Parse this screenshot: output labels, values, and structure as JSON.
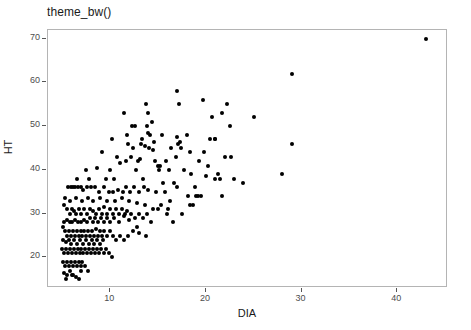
{
  "chart_data": {
    "type": "scatter",
    "title": "theme_bw()",
    "xlabel": "DIA",
    "ylabel": "HT",
    "grid": false,
    "legend": "none",
    "xlim": [
      3.5,
      45.3
    ],
    "ylim": [
      13.0,
      72.0
    ],
    "xticks": [
      10,
      20,
      30,
      40
    ],
    "xticklabels": [
      "10",
      "20",
      "30",
      "40"
    ],
    "yticks": [
      20,
      30,
      40,
      50,
      60,
      70
    ],
    "yticklabels": [
      "20",
      "30",
      "40",
      "50",
      "60",
      "70"
    ],
    "point_color": "#000000",
    "panel_border_color": "#b4b4b4",
    "panel_background": "#ffffff",
    "n_points": 271,
    "series": [
      {
        "name": "trees",
        "points": [
          [
            43.0,
            70.0
          ],
          [
            29.0,
            62.0
          ],
          [
            29.0,
            46.0
          ],
          [
            28.0,
            39.0
          ],
          [
            25.0,
            52.0
          ],
          [
            17.0,
            58.0
          ],
          [
            19.7,
            56.0
          ],
          [
            13.7,
            55.0
          ],
          [
            17.2,
            55.0
          ],
          [
            22.2,
            55.0
          ],
          [
            11.4,
            53.0
          ],
          [
            14.0,
            53.0
          ],
          [
            21.7,
            53.0
          ],
          [
            20.6,
            52.0
          ],
          [
            12.3,
            50.0
          ],
          [
            14.4,
            51.0
          ],
          [
            22.5,
            50.0
          ],
          [
            12.6,
            50.0
          ],
          [
            13.8,
            50.0
          ],
          [
            10.2,
            47.0
          ],
          [
            11.9,
            46.0
          ],
          [
            13.3,
            47.0
          ],
          [
            14.2,
            48.0
          ],
          [
            15.4,
            48.0
          ],
          [
            17.0,
            47.5
          ],
          [
            17.3,
            46.5
          ],
          [
            18.0,
            48.0
          ],
          [
            20.4,
            47.0
          ],
          [
            20.9,
            47.0
          ],
          [
            21.0,
            47.0
          ],
          [
            13.6,
            45.5
          ],
          [
            14.1,
            45.0
          ],
          [
            14.5,
            44.5
          ],
          [
            16.4,
            45.0
          ],
          [
            17.1,
            46.0
          ],
          [
            17.4,
            45.0
          ],
          [
            18.3,
            44.0
          ],
          [
            19.8,
            44.0
          ],
          [
            9.1,
            44.0
          ],
          [
            12.2,
            43.0
          ],
          [
            12.9,
            42.0
          ],
          [
            13.1,
            42.5
          ],
          [
            14.7,
            42.0
          ],
          [
            15.0,
            41.0
          ],
          [
            22.0,
            43.0
          ],
          [
            23.9,
            37.0
          ],
          [
            22.9,
            38.0
          ],
          [
            21.5,
            38.0
          ],
          [
            8.6,
            40.5
          ],
          [
            7.5,
            40.0
          ],
          [
            10.0,
            40.0
          ],
          [
            11.0,
            41.5
          ],
          [
            12.7,
            40.0
          ],
          [
            15.1,
            40.0
          ],
          [
            17.7,
            40.0
          ],
          [
            18.4,
            39.0
          ],
          [
            20.0,
            38.5
          ],
          [
            20.9,
            38.0
          ],
          [
            6.5,
            38.0
          ],
          [
            7.8,
            38.0
          ],
          [
            9.6,
            38.0
          ],
          [
            10.4,
            38.0
          ],
          [
            13.4,
            38.0
          ],
          [
            15.5,
            37.0
          ],
          [
            16.7,
            37.0
          ],
          [
            18.9,
            36.0
          ],
          [
            19.5,
            34.0
          ],
          [
            21.7,
            34.0
          ],
          [
            5.6,
            36.0
          ],
          [
            5.9,
            36.0
          ],
          [
            6.1,
            36.0
          ],
          [
            6.3,
            36.0
          ],
          [
            6.6,
            36.0
          ],
          [
            6.9,
            36.0
          ],
          [
            7.2,
            35.5
          ],
          [
            7.6,
            36.0
          ],
          [
            8.0,
            36.0
          ],
          [
            8.4,
            36.0
          ],
          [
            8.8,
            35.0
          ],
          [
            9.3,
            36.0
          ],
          [
            9.9,
            35.0
          ],
          [
            10.3,
            35.0
          ],
          [
            10.8,
            35.5
          ],
          [
            11.3,
            35.0
          ],
          [
            11.7,
            36.0
          ],
          [
            12.1,
            35.0
          ],
          [
            12.5,
            36.0
          ],
          [
            13.0,
            35.0
          ],
          [
            13.5,
            36.0
          ],
          [
            14.0,
            35.5
          ],
          [
            14.8,
            35.0
          ],
          [
            15.7,
            35.0
          ],
          [
            16.3,
            33.0
          ],
          [
            17.0,
            36.0
          ],
          [
            18.1,
            34.0
          ],
          [
            19.0,
            34.0
          ],
          [
            5.2,
            32.0
          ],
          [
            5.5,
            31.0
          ],
          [
            5.8,
            30.0
          ],
          [
            6.0,
            31.0
          ],
          [
            6.2,
            30.5
          ],
          [
            6.4,
            30.0
          ],
          [
            6.7,
            31.0
          ],
          [
            7.0,
            30.0
          ],
          [
            7.3,
            31.0
          ],
          [
            7.6,
            30.0
          ],
          [
            7.9,
            31.0
          ],
          [
            8.2,
            30.5
          ],
          [
            8.5,
            30.0
          ],
          [
            8.8,
            31.0
          ],
          [
            9.1,
            30.0
          ],
          [
            9.4,
            31.5
          ],
          [
            9.7,
            30.0
          ],
          [
            10.0,
            31.0
          ],
          [
            10.3,
            30.0
          ],
          [
            10.6,
            31.0
          ],
          [
            10.9,
            30.0
          ],
          [
            11.2,
            31.0
          ],
          [
            11.5,
            30.0
          ],
          [
            11.8,
            30.5
          ],
          [
            12.2,
            30.0
          ],
          [
            12.6,
            29.0
          ],
          [
            13.0,
            30.0
          ],
          [
            13.4,
            29.0
          ],
          [
            13.8,
            30.0
          ],
          [
            14.3,
            28.0
          ],
          [
            15.0,
            31.0
          ],
          [
            15.9,
            30.0
          ],
          [
            16.6,
            28.0
          ],
          [
            17.5,
            30.0
          ],
          [
            18.3,
            32.0
          ],
          [
            19.2,
            34.0
          ],
          [
            5.1,
            27.0
          ],
          [
            5.3,
            26.0
          ],
          [
            5.5,
            25.0
          ],
          [
            5.7,
            26.0
          ],
          [
            5.9,
            25.0
          ],
          [
            6.1,
            26.0
          ],
          [
            6.3,
            25.0
          ],
          [
            6.5,
            26.0
          ],
          [
            6.7,
            25.0
          ],
          [
            6.9,
            26.0
          ],
          [
            7.1,
            25.0
          ],
          [
            7.3,
            26.0
          ],
          [
            7.5,
            25.0
          ],
          [
            7.7,
            26.0
          ],
          [
            7.9,
            25.0
          ],
          [
            8.1,
            26.0
          ],
          [
            8.3,
            25.0
          ],
          [
            8.5,
            26.5
          ],
          [
            8.7,
            25.0
          ],
          [
            8.9,
            26.0
          ],
          [
            9.1,
            25.0
          ],
          [
            9.4,
            26.0
          ],
          [
            9.7,
            25.0
          ],
          [
            10.0,
            26.0
          ],
          [
            10.3,
            25.0
          ],
          [
            10.6,
            24.0
          ],
          [
            11.0,
            25.0
          ],
          [
            11.4,
            24.0
          ],
          [
            11.9,
            25.0
          ],
          [
            12.4,
            26.0
          ],
          [
            13.0,
            25.5
          ],
          [
            13.7,
            25.0
          ],
          [
            5.0,
            22.0
          ],
          [
            5.2,
            21.0
          ],
          [
            5.4,
            22.0
          ],
          [
            5.6,
            21.0
          ],
          [
            5.8,
            22.0
          ],
          [
            6.0,
            21.0
          ],
          [
            6.2,
            22.0
          ],
          [
            6.4,
            21.0
          ],
          [
            6.6,
            22.0
          ],
          [
            6.8,
            21.0
          ],
          [
            7.0,
            22.0
          ],
          [
            7.2,
            21.0
          ],
          [
            7.4,
            22.0
          ],
          [
            7.6,
            21.0
          ],
          [
            7.8,
            22.0
          ],
          [
            8.0,
            21.0
          ],
          [
            8.2,
            22.0
          ],
          [
            8.4,
            21.0
          ],
          [
            8.6,
            22.0
          ],
          [
            8.8,
            21.0
          ],
          [
            9.0,
            22.0
          ],
          [
            9.3,
            21.0
          ],
          [
            9.6,
            22.0
          ],
          [
            9.9,
            21.0
          ],
          [
            10.2,
            20.0
          ],
          [
            5.1,
            19.0
          ],
          [
            5.3,
            18.0
          ],
          [
            5.5,
            19.0
          ],
          [
            5.7,
            18.0
          ],
          [
            5.9,
            19.0
          ],
          [
            6.1,
            18.0
          ],
          [
            6.3,
            19.0
          ],
          [
            6.5,
            18.0
          ],
          [
            6.7,
            19.0
          ],
          [
            6.9,
            18.0
          ],
          [
            7.1,
            19.0
          ],
          [
            7.4,
            18.0
          ],
          [
            7.7,
            17.0
          ],
          [
            5.2,
            16.5
          ],
          [
            5.5,
            16.0
          ],
          [
            5.8,
            17.0
          ],
          [
            6.1,
            16.0
          ],
          [
            6.4,
            15.5
          ],
          [
            6.7,
            15.0
          ],
          [
            5.4,
            15.0
          ],
          [
            6.0,
            16.0
          ],
          [
            6.9,
            17.0
          ],
          [
            5.05,
            24.0
          ],
          [
            5.35,
            23.5
          ],
          [
            5.65,
            24.0
          ],
          [
            5.95,
            23.0
          ],
          [
            6.25,
            24.0
          ],
          [
            6.55,
            23.0
          ],
          [
            6.85,
            24.0
          ],
          [
            7.15,
            23.0
          ],
          [
            7.45,
            24.0
          ],
          [
            7.75,
            23.0
          ],
          [
            8.05,
            24.0
          ],
          [
            8.35,
            23.0
          ],
          [
            8.65,
            24.0
          ],
          [
            8.95,
            23.0
          ],
          [
            9.25,
            24.0
          ],
          [
            5.15,
            28.0
          ],
          [
            5.45,
            28.5
          ],
          [
            5.75,
            28.0
          ],
          [
            6.05,
            28.0
          ],
          [
            6.35,
            28.5
          ],
          [
            6.65,
            28.0
          ],
          [
            6.95,
            28.0
          ],
          [
            7.25,
            28.5
          ],
          [
            7.55,
            28.0
          ],
          [
            7.85,
            29.0
          ],
          [
            8.15,
            28.0
          ],
          [
            8.45,
            29.0
          ],
          [
            8.75,
            28.0
          ],
          [
            9.05,
            29.0
          ],
          [
            9.35,
            28.0
          ],
          [
            9.65,
            29.0
          ],
          [
            9.95,
            28.0
          ],
          [
            10.4,
            29.0
          ],
          [
            10.9,
            28.0
          ],
          [
            11.4,
            29.5
          ],
          [
            12.0,
            28.5
          ],
          [
            12.8,
            27.0
          ],
          [
            14.5,
            31.0
          ],
          [
            5.25,
            33.5
          ],
          [
            5.85,
            33.0
          ],
          [
            6.45,
            33.5
          ],
          [
            7.05,
            33.0
          ],
          [
            7.65,
            33.5
          ],
          [
            8.25,
            33.0
          ],
          [
            8.95,
            33.5
          ],
          [
            9.65,
            33.0
          ],
          [
            10.5,
            33.0
          ],
          [
            11.2,
            33.5
          ],
          [
            12.0,
            33.0
          ],
          [
            12.8,
            32.5
          ],
          [
            13.6,
            32.0
          ],
          [
            15.3,
            32.0
          ],
          [
            16.0,
            31.0
          ],
          [
            18.7,
            32.0
          ],
          [
            10.7,
            43.0
          ],
          [
            11.6,
            42.0
          ],
          [
            12.4,
            45.0
          ],
          [
            13.2,
            46.0
          ],
          [
            14.6,
            46.5
          ],
          [
            15.8,
            42.0
          ],
          [
            16.9,
            43.0
          ],
          [
            19.3,
            42.0
          ],
          [
            22.6,
            43.0
          ],
          [
            11.8,
            48.0
          ],
          [
            13.9,
            48.5
          ],
          [
            15.2,
            41.0
          ],
          [
            16.1,
            40.0
          ],
          [
            20.2,
            41.0
          ],
          [
            21.3,
            39.0
          ]
        ]
      }
    ]
  }
}
